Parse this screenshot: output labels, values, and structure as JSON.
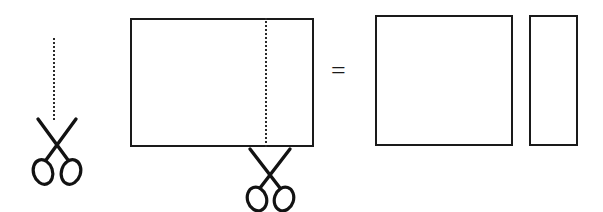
{
  "canvas": {
    "width": 603,
    "height": 212,
    "background": "#ffffff",
    "ink": "#1a1a1a"
  },
  "diagram": {
    "type": "geometry-cut-illustration",
    "equation_symbol": "=",
    "stroke_color": "#1a1a1a",
    "stroke_width_px": 2,
    "dotted_line_color": "#2a2a2a"
  },
  "shapes": {
    "source_rectangle": {
      "label": "source-rectangle",
      "x": 130,
      "y": 18,
      "width": 184,
      "height": 129
    },
    "cut_line": {
      "label": "cut-line",
      "x": 265,
      "y": 18,
      "height": 129,
      "style": "dotted"
    },
    "result_square": {
      "label": "result-square",
      "x": 375,
      "y": 15,
      "width": 138,
      "height": 131
    },
    "result_strip": {
      "label": "result-strip",
      "x": 529,
      "y": 15,
      "width": 49,
      "height": 131
    }
  },
  "annotations": {
    "legend_cut_line": {
      "label": "legend-cut-line",
      "x": 53,
      "y": 38,
      "height": 82,
      "style": "dotted"
    },
    "equals": {
      "text": "=",
      "x": 331,
      "y": 58,
      "font_size_px": 26
    }
  },
  "scissors": [
    {
      "name": "scissors-legend",
      "x": 30,
      "y": 118,
      "width": 54,
      "height": 68,
      "rotation_deg": 0
    },
    {
      "name": "scissors-cutting",
      "x": 243,
      "y": 148,
      "width": 54,
      "height": 64,
      "rotation_deg": 0
    }
  ]
}
